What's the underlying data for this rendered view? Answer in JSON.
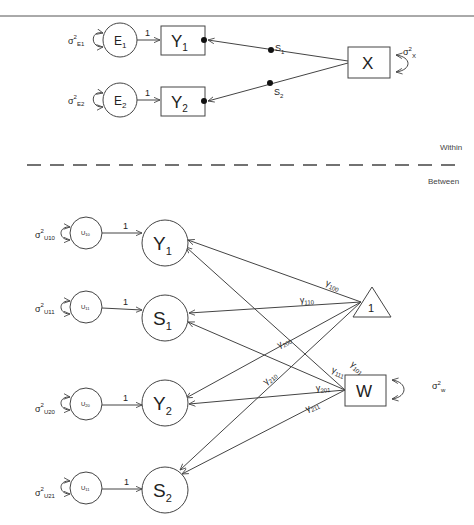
{
  "diagram": {
    "type": "multilevel-path-diagram",
    "sections": {
      "within_label": "Within",
      "between_label": "Between"
    },
    "within": {
      "residuals": [
        {
          "id": "E1",
          "label": "E",
          "sub": "1",
          "variance_label": "σ",
          "variance_sup": "2",
          "variance_sub": "E1"
        },
        {
          "id": "E2",
          "label": "E",
          "sub": "2",
          "variance_label": "σ",
          "variance_sup": "2",
          "variance_sub": "E2"
        }
      ],
      "outcomes": [
        {
          "id": "Y1",
          "label": "Y",
          "sub": "1"
        },
        {
          "id": "Y2",
          "label": "Y",
          "sub": "2"
        }
      ],
      "predictor": {
        "id": "X",
        "label": "X",
        "variance_label": "σ",
        "variance_sup": "2",
        "variance_sub": "X"
      },
      "loadings": [
        {
          "from": "E1",
          "to": "Y1",
          "label": "1"
        },
        {
          "from": "E2",
          "to": "Y2",
          "label": "1"
        }
      ],
      "random_slopes": [
        {
          "from": "X",
          "to": "Y1",
          "label": "S",
          "sub": "1"
        },
        {
          "from": "X",
          "to": "Y2",
          "label": "S",
          "sub": "2"
        }
      ]
    },
    "between": {
      "residuals": [
        {
          "id": "U10",
          "label": "U",
          "sub": "10",
          "variance_label": "σ",
          "variance_sup": "2",
          "variance_sub": "U10"
        },
        {
          "id": "U11",
          "label": "U",
          "sub": "11",
          "variance_label": "σ",
          "variance_sup": "2",
          "variance_sub": "U11"
        },
        {
          "id": "U20",
          "label": "U",
          "sub": "20",
          "variance_label": "σ",
          "variance_sup": "2",
          "variance_sub": "U20"
        },
        {
          "id": "U21",
          "label": "U",
          "sub": "11",
          "variance_label": "σ",
          "variance_sup": "2",
          "variance_sub": "U21"
        }
      ],
      "latents": [
        {
          "id": "Y1",
          "label": "Y",
          "sub": "1"
        },
        {
          "id": "S1",
          "label": "S",
          "sub": "1"
        },
        {
          "id": "Y2",
          "label": "Y",
          "sub": "2"
        },
        {
          "id": "S2",
          "label": "S",
          "sub": "2"
        }
      ],
      "loadings": [
        {
          "from": "U10",
          "to": "Y1",
          "label": "1"
        },
        {
          "from": "U11",
          "to": "S1",
          "label": "1"
        },
        {
          "from": "U20",
          "to": "Y2",
          "label": "1"
        },
        {
          "from": "U21",
          "to": "S2",
          "label": "1"
        }
      ],
      "intercept": {
        "id": "const",
        "label": "1"
      },
      "covariate": {
        "id": "W",
        "label": "W",
        "variance_label": "σ",
        "variance_sup": "2",
        "variance_sub": "w"
      },
      "paths": [
        {
          "from": "const",
          "to": "Y1",
          "label": "γ",
          "sub": "100"
        },
        {
          "from": "const",
          "to": "S1",
          "label": "γ",
          "sub": "110"
        },
        {
          "from": "const",
          "to": "Y2",
          "label": "γ",
          "sub": "200"
        },
        {
          "from": "const",
          "to": "S2",
          "label": "γ",
          "sub": "210"
        },
        {
          "from": "W",
          "to": "Y1",
          "label": "γ",
          "sub": "101"
        },
        {
          "from": "W",
          "to": "S1",
          "label": "γ",
          "sub": "111"
        },
        {
          "from": "W",
          "to": "Y2",
          "label": "γ",
          "sub": "201"
        },
        {
          "from": "W",
          "to": "S2",
          "label": "γ",
          "sub": "211"
        }
      ]
    }
  }
}
